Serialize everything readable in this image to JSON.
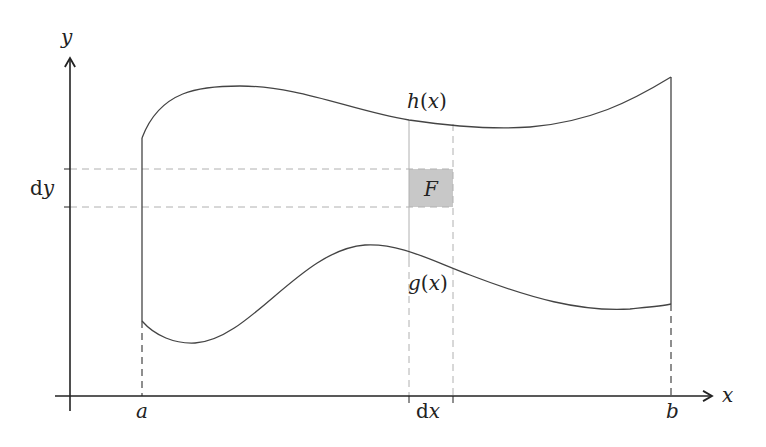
{
  "diagram": {
    "type": "region-integral-illustration",
    "axes": {
      "x_label": "x",
      "y_label": "y"
    },
    "x_ticks": [
      {
        "label": "a",
        "italic": true
      },
      {
        "label_roman": "d",
        "label_italic": "x"
      },
      {
        "label": "b",
        "italic": true
      }
    ],
    "y_ticks": [
      {
        "label_roman": "d",
        "label_italic": "y"
      }
    ],
    "curves": {
      "upper": {
        "name": "h",
        "label": "h(x)",
        "label_func": "h",
        "label_open": "(",
        "label_var": "x",
        "label_close": ")"
      },
      "lower": {
        "name": "g",
        "label": "g(x)",
        "label_func": "g",
        "label_open": "(",
        "label_var": "x",
        "label_close": ")"
      }
    },
    "element": {
      "label": "F",
      "fill_color": "#c8c8c8"
    },
    "colors": {
      "axis": "#222222",
      "curve": "#444444",
      "guide_dashed": "#b0b0b0",
      "guide_dark_dashed": "#444444"
    }
  }
}
